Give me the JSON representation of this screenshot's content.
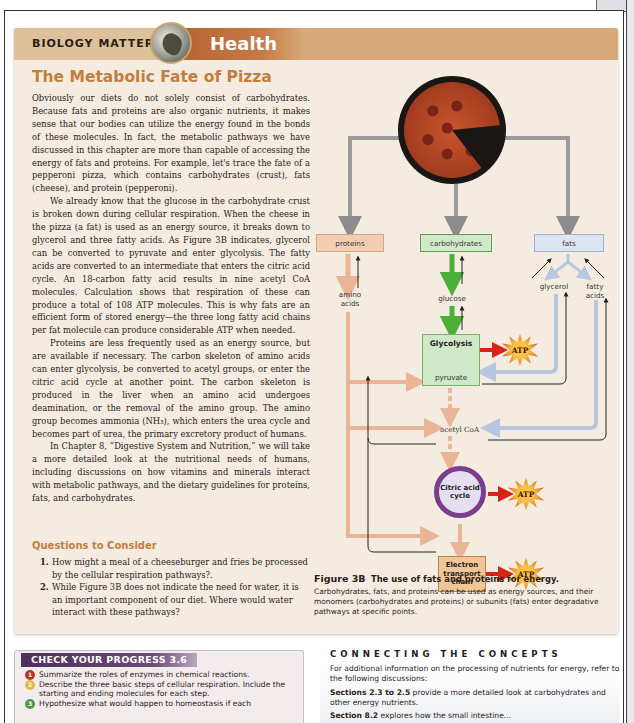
{
  "feature": {
    "series_label": "BIOLOGY MATTERS",
    "category": "Health",
    "title": "The Metabolic Fate of Pizza",
    "paragraphs": [
      "Obviously our diets do not solely consist of carbohydrates. Because fats and proteins are also organic nutrients, it makes sense that our bodies can utilize the energy found in the bonds of these molecules. In fact, the metabolic pathways we have discussed in this chapter are more than capable of accessing the energy of fats and proteins. For example, let's trace the fate of a pepperoni pizza, which contains carbohydrates (crust), fats (cheese), and protein (pepperoni).",
      "We already know that the glucose in the carbohydrate crust is broken down during cellular respiration. When the cheese in the pizza (a fat) is used as an energy source, it breaks down to glycerol and three fatty acids. As Figure 3B indicates, glycerol can be converted to pyruvate and enter glycolysis. The fatty acids are converted to an intermediate that enters the citric acid cycle. An 18-carbon fatty acid results in nine acetyl CoA molecules. Calculation shows that respiration of these can produce a total of 108 ATP molecules. This is why fats are an efficient form of stored energy—the three long fatty acid chains per fat molecule can produce considerable ATP when needed.",
      "Proteins are less frequently used as an energy source, but are available if necessary. The carbon skeleton of amino acids can enter glycolysis, be converted to acetyl groups, or enter the citric acid cycle at another point. The carbon skeleton is produced in the liver when an amino acid undergoes deamination, or the removal of the amino group. The amino group becomes ammonia (NH₃), which enters the urea cycle and becomes part of urea, the primary excretory product of humans.",
      "In Chapter 8, “Digestive System and Nutrition,” we will take a more detailed look at the nutritional needs of humans, including discussions on how vitamins and minerals interact with metabolic pathways, and the dietary guidelines for proteins, fats, and carbohydrates."
    ],
    "questions_title": "Questions to Consider",
    "questions": [
      {
        "num": "1.",
        "text": "How might a meal of a cheeseburger and fries be processed by the cellular respiration pathways?."
      },
      {
        "num": "2.",
        "text": "While Figure 3B does not indicate the need for water, it is an important component of our diet. Where would water interact with these pathways?"
      }
    ]
  },
  "diagram": {
    "source": "pepperoni pizza",
    "nutrients": {
      "proteins": "proteins",
      "carbohydrates": "carbohydrates",
      "fats": "fats"
    },
    "monomers": {
      "amino_acids": "amino acids",
      "glucose": "glucose",
      "glycerol": "glycerol",
      "fatty_acids": "fatty acids"
    },
    "glycolysis": "Glycolysis",
    "pyruvate": "pyruvate",
    "acetyl_coa": "acetyl CoA",
    "citric_cycle": "Citric acid cycle",
    "etc": "Electron transport chain",
    "atp": "ATP",
    "colors": {
      "protein_arrow": "#eab596",
      "carb_arrow": "#4caf3a",
      "fat_arrow": "#b9c6df",
      "atp_arrow": "#d62418",
      "cycle": "#7a3e8c"
    }
  },
  "figure": {
    "label": "Figure 3B",
    "title": "The use of fats and proteins for energy.",
    "caption": "Carbohydrates, fats, and proteins can be used as energy sources, and their monomers (carbohydrates and proteins) or subunits (fats) enter degradative pathways at specific points."
  },
  "progress": {
    "title": "CHECK YOUR PROGRESS 3.6",
    "items": [
      {
        "num": "1",
        "color": "#b8391f",
        "text": "Summarize the roles of enzymes in chemical reactions."
      },
      {
        "num": "2",
        "color": "#e0b845",
        "text": "Describe the three basic steps of cellular respiration. Include the starting and ending molecules for each step."
      },
      {
        "num": "3",
        "color": "#4f9a45",
        "text": "Hypothesize what would happen to homeostasis if each"
      }
    ]
  },
  "concepts": {
    "title": "CONNECTING THE CONCEPTS",
    "intro": "For additional information on the processing of nutrients for energy, refer to the following discussions:",
    "refs": [
      {
        "bold": "Sections 2.3 to 2.5",
        "text": " provide a more detailed look at carbohydrates and other energy nutrients."
      },
      {
        "bold": "Section 8.2",
        "text": " explores how the small intestine..."
      }
    ]
  }
}
